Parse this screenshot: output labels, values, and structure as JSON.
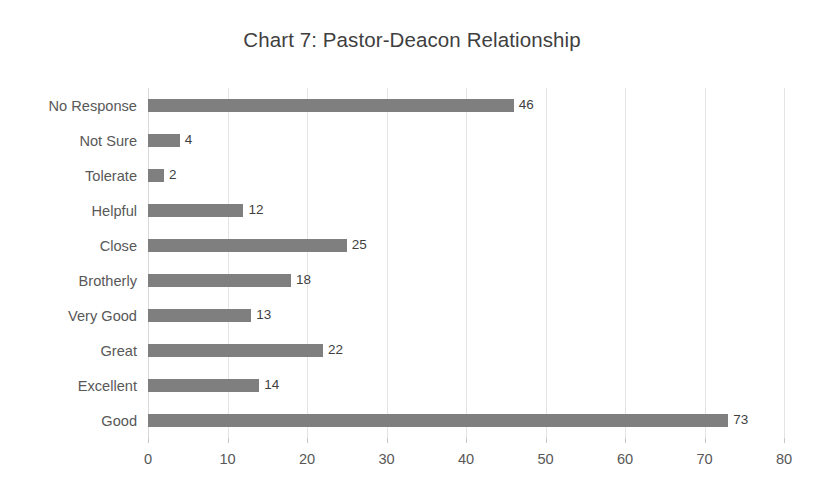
{
  "chart_data": {
    "type": "bar",
    "orientation": "horizontal",
    "title": "Chart 7: Pastor-Deacon Relationship",
    "xlabel": "",
    "ylabel": "",
    "categories": [
      "No Response",
      "Not Sure",
      "Tolerate",
      "Helpful",
      "Close",
      "Brotherly",
      "Very Good",
      "Great",
      "Excellent",
      "Good"
    ],
    "values": [
      46,
      4,
      2,
      12,
      25,
      18,
      13,
      22,
      14,
      73
    ],
    "data_labels": [
      "46",
      "4",
      "2",
      "12",
      "25",
      "18",
      "13",
      "22",
      "14",
      "73"
    ],
    "xlim": [
      0,
      80
    ],
    "xticks": [
      0,
      10,
      20,
      30,
      40,
      50,
      60,
      70,
      80
    ],
    "xtick_labels": [
      "0",
      "10",
      "20",
      "30",
      "40",
      "50",
      "60",
      "70",
      "80"
    ],
    "grid": "vertical-only",
    "legend": "none",
    "colors": {
      "bar": "#7f7f7f",
      "gridline": "#e4e4e4",
      "axis_line": "#d9d9d9",
      "title_text": "#3f3f3f",
      "tick_text": "#585858",
      "data_label_text": "#3f3f3f",
      "background": "#ffffff"
    }
  }
}
